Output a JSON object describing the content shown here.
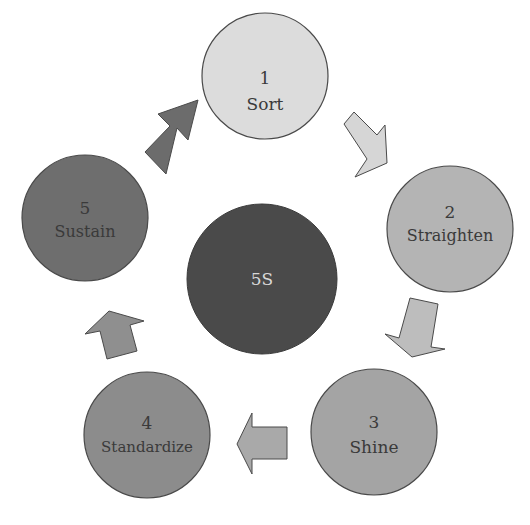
{
  "diagram": {
    "title": "5S",
    "center": {
      "label": "5S",
      "fill": "#4a4a4a",
      "text_color": "#d8d8d8"
    },
    "steps": [
      {
        "number": "1",
        "label": "Sort",
        "fill": "#dcdcdc"
      },
      {
        "number": "2",
        "label": "Straighten",
        "fill": "#b4b4b4"
      },
      {
        "number": "3",
        "label": "Shine",
        "fill": "#a4a4a4"
      },
      {
        "number": "4",
        "label": "Standardize",
        "fill": "#8c8c8c"
      },
      {
        "number": "5",
        "label": "Sustain",
        "fill": "#6e6e6e"
      }
    ],
    "arrows": [
      {
        "from": "1",
        "to": "2",
        "fill": "#d6d6d6"
      },
      {
        "from": "2",
        "to": "3",
        "fill": "#bdbdbd"
      },
      {
        "from": "3",
        "to": "4",
        "fill": "#a9a9a9"
      },
      {
        "from": "4",
        "to": "5",
        "fill": "#8f8f8f"
      },
      {
        "from": "5",
        "to": "1",
        "fill": "#6c6c6c"
      }
    ],
    "stroke": "#4a4a4a"
  }
}
